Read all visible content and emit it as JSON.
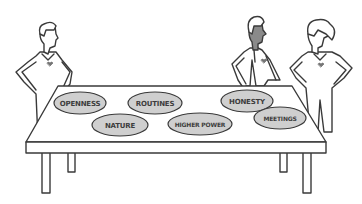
{
  "illustration": {
    "subject": "three people standing around a table with topic cards",
    "colors": {
      "line": "#3a3a3a",
      "oval_fill": "#cfcfcf",
      "skin_dark": "#8a8a8a",
      "background": "#ffffff"
    },
    "figures": [
      {
        "name": "left-person",
        "face": "light"
      },
      {
        "name": "middle-person",
        "face": "dark"
      },
      {
        "name": "right-person",
        "face": "light",
        "hair": "ponytail"
      }
    ],
    "ovals": [
      {
        "label": "OPENNESS"
      },
      {
        "label": "ROUTINES"
      },
      {
        "label": "HONESTY"
      },
      {
        "label": "NATURE"
      },
      {
        "label": "HIGHER POWER"
      },
      {
        "label": "MEETINGS"
      }
    ]
  }
}
